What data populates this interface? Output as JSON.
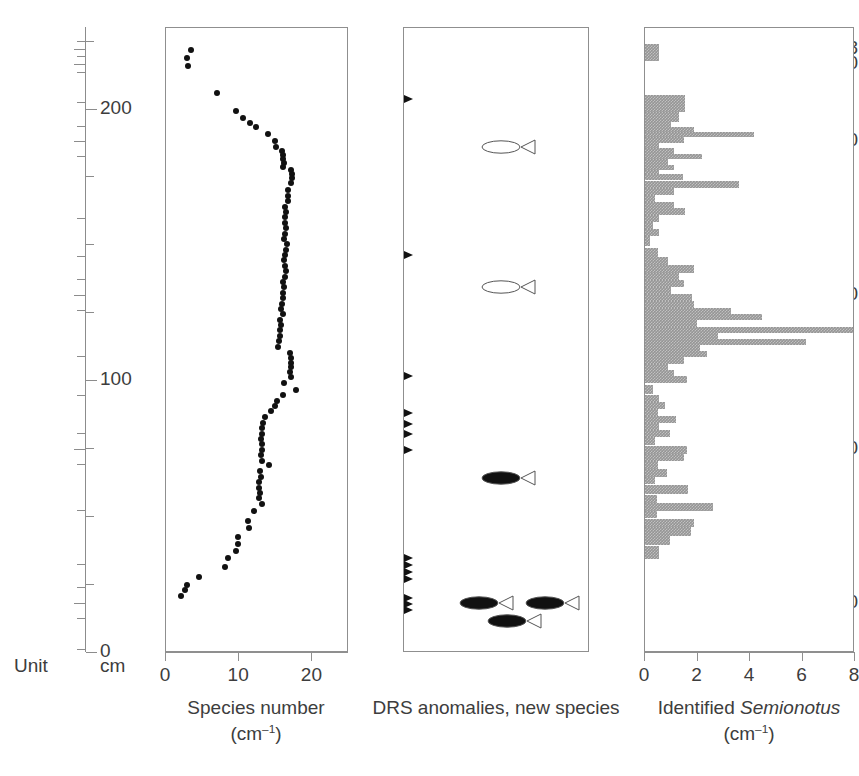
{
  "axes": {
    "unit_caption": "Unit",
    "cm_caption": "cm",
    "unit_ticks": [
      {
        "label": "118",
        "v": 118
      },
      {
        "label": "120",
        "v": 120
      },
      {
        "label": "130",
        "v": 130
      },
      {
        "label": "150",
        "v": 150
      },
      {
        "label": "170",
        "v": 170
      },
      {
        "label": "190",
        "v": 190
      }
    ],
    "unit_minor": [
      117,
      119,
      121,
      125,
      128,
      132,
      140,
      145,
      148,
      152,
      158,
      163,
      168,
      172,
      178,
      185,
      188,
      192,
      196
    ],
    "cm_ticks": [
      {
        "label": "200",
        "v": 200
      },
      {
        "label": "100",
        "v": 100
      },
      {
        "label": "0",
        "v": 0
      }
    ],
    "cm_range": [
      0,
      230
    ]
  },
  "chart_data": [
    {
      "type": "scatter",
      "panel": "species-number",
      "title": "",
      "xlabel": "Species number",
      "xlabel_unit": "(cm–1)",
      "ylabel": "Unit",
      "xlim": [
        0,
        25
      ],
      "ylim": [
        196,
        115
      ],
      "xticks": [
        0,
        10,
        20
      ],
      "xticklabels": [
        "0",
        "10",
        "20"
      ],
      "grid": false,
      "points": [
        {
          "x": 3.4,
          "y": 118.0
        },
        {
          "x": 2.9,
          "y": 119.1
        },
        {
          "x": 3.1,
          "y": 120.2
        },
        {
          "x": 7.1,
          "y": 123.7
        },
        {
          "x": 9.6,
          "y": 126.0
        },
        {
          "x": 10.7,
          "y": 126.9
        },
        {
          "x": 11.6,
          "y": 127.5
        },
        {
          "x": 12.4,
          "y": 128.1
        },
        {
          "x": 14.1,
          "y": 129.0
        },
        {
          "x": 15.1,
          "y": 129.9
        },
        {
          "x": 15.2,
          "y": 130.6
        },
        {
          "x": 16.0,
          "y": 131.2
        },
        {
          "x": 16.1,
          "y": 131.7
        },
        {
          "x": 16.2,
          "y": 132.2
        },
        {
          "x": 16.3,
          "y": 132.7
        },
        {
          "x": 16.2,
          "y": 133.2
        },
        {
          "x": 17.3,
          "y": 133.6
        },
        {
          "x": 17.4,
          "y": 134.2
        },
        {
          "x": 17.4,
          "y": 134.7
        },
        {
          "x": 17.2,
          "y": 135.4
        },
        {
          "x": 16.9,
          "y": 136.2
        },
        {
          "x": 16.8,
          "y": 137.0
        },
        {
          "x": 16.9,
          "y": 137.7
        },
        {
          "x": 16.5,
          "y": 138.4
        },
        {
          "x": 16.6,
          "y": 139.1
        },
        {
          "x": 16.4,
          "y": 139.8
        },
        {
          "x": 16.5,
          "y": 140.5
        },
        {
          "x": 16.6,
          "y": 141.2
        },
        {
          "x": 16.4,
          "y": 141.9
        },
        {
          "x": 16.3,
          "y": 142.6
        },
        {
          "x": 16.7,
          "y": 143.3
        },
        {
          "x": 16.6,
          "y": 144.0
        },
        {
          "x": 16.4,
          "y": 144.7
        },
        {
          "x": 16.3,
          "y": 145.4
        },
        {
          "x": 16.5,
          "y": 146.1
        },
        {
          "x": 16.6,
          "y": 146.8
        },
        {
          "x": 16.4,
          "y": 147.5
        },
        {
          "x": 16.2,
          "y": 148.2
        },
        {
          "x": 16.3,
          "y": 148.9
        },
        {
          "x": 16.1,
          "y": 149.6
        },
        {
          "x": 16.2,
          "y": 150.3
        },
        {
          "x": 16.0,
          "y": 151.0
        },
        {
          "x": 15.9,
          "y": 151.7
        },
        {
          "x": 16.1,
          "y": 152.4
        },
        {
          "x": 15.8,
          "y": 153.1
        },
        {
          "x": 15.9,
          "y": 153.8
        },
        {
          "x": 15.7,
          "y": 154.5
        },
        {
          "x": 15.8,
          "y": 155.2
        },
        {
          "x": 15.6,
          "y": 155.9
        },
        {
          "x": 15.5,
          "y": 156.6
        },
        {
          "x": 17.1,
          "y": 157.4
        },
        {
          "x": 17.2,
          "y": 158.1
        },
        {
          "x": 17.3,
          "y": 158.7
        },
        {
          "x": 17.2,
          "y": 159.3
        },
        {
          "x": 17.1,
          "y": 159.9
        },
        {
          "x": 17.2,
          "y": 160.5
        },
        {
          "x": 16.3,
          "y": 161.3
        },
        {
          "x": 18.0,
          "y": 162.2
        },
        {
          "x": 16.1,
          "y": 162.9
        },
        {
          "x": 15.3,
          "y": 163.7
        },
        {
          "x": 15.0,
          "y": 164.3
        },
        {
          "x": 14.5,
          "y": 165.0
        },
        {
          "x": 13.7,
          "y": 165.8
        },
        {
          "x": 13.4,
          "y": 166.5
        },
        {
          "x": 13.3,
          "y": 167.2
        },
        {
          "x": 13.2,
          "y": 167.9
        },
        {
          "x": 13.1,
          "y": 168.6
        },
        {
          "x": 13.2,
          "y": 169.3
        },
        {
          "x": 13.3,
          "y": 170.0
        },
        {
          "x": 13.1,
          "y": 170.7
        },
        {
          "x": 13.2,
          "y": 171.4
        },
        {
          "x": 14.2,
          "y": 172.0
        },
        {
          "x": 13.0,
          "y": 172.8
        },
        {
          "x": 13.1,
          "y": 173.5
        },
        {
          "x": 12.9,
          "y": 174.2
        },
        {
          "x": 12.8,
          "y": 174.9
        },
        {
          "x": 13.0,
          "y": 175.6
        },
        {
          "x": 12.9,
          "y": 176.3
        },
        {
          "x": 13.2,
          "y": 177.0
        },
        {
          "x": 12.1,
          "y": 178.0
        },
        {
          "x": 11.3,
          "y": 179.2
        },
        {
          "x": 11.5,
          "y": 180.1
        },
        {
          "x": 10.0,
          "y": 181.3
        },
        {
          "x": 9.9,
          "y": 182.2
        },
        {
          "x": 9.6,
          "y": 183.1
        },
        {
          "x": 8.6,
          "y": 184.0
        },
        {
          "x": 8.1,
          "y": 185.2
        },
        {
          "x": 4.6,
          "y": 186.5
        },
        {
          "x": 2.9,
          "y": 187.6
        },
        {
          "x": 2.6,
          "y": 188.2
        },
        {
          "x": 2.1,
          "y": 189.0
        }
      ]
    },
    {
      "type": "scatter",
      "panel": "drs-anomalies",
      "title": "",
      "xlabel": "DRS anomalies, new species",
      "xlabel_unit": "",
      "xlim": [
        0,
        1
      ],
      "ylim": [
        196,
        115
      ],
      "xticks": [],
      "grid": false,
      "arrows": [
        {
          "y": 124.4
        },
        {
          "y": 144.7
        },
        {
          "y": 160.4
        },
        {
          "y": 165.2
        },
        {
          "y": 166.6
        },
        {
          "y": 167.9
        },
        {
          "y": 170.0
        },
        {
          "y": 184.0
        },
        {
          "y": 185.0
        },
        {
          "y": 185.9
        },
        {
          "y": 186.8
        },
        {
          "y": 189.2
        },
        {
          "y": 190.0
        },
        {
          "y": 190.8
        }
      ],
      "fish": [
        {
          "y": 130.7,
          "x": 0.42,
          "filled": false
        },
        {
          "y": 148.9,
          "x": 0.42,
          "filled": false
        },
        {
          "y": 173.6,
          "x": 0.42,
          "filled": true
        },
        {
          "y": 189.9,
          "x": 0.3,
          "filled": true
        },
        {
          "y": 189.9,
          "x": 0.66,
          "filled": true
        },
        {
          "y": 192.2,
          "x": 0.45,
          "filled": true
        }
      ]
    },
    {
      "type": "bar",
      "orientation": "horizontal",
      "panel": "identified-semionotus",
      "title": "",
      "xlabel": "Identified Semionotus",
      "xlabel_italic_word": "Semionotus",
      "xlabel_unit": "(cm–1)",
      "xlim": [
        0,
        8
      ],
      "ylim": [
        196,
        115
      ],
      "xticks": [
        0,
        2,
        4,
        6,
        8
      ],
      "xticklabels": [
        "0",
        "2",
        "4",
        "6",
        "8"
      ],
      "grid": false,
      "bars": [
        {
          "y": 118.4,
          "h": 2.3,
          "value": 0.55
        },
        {
          "y": 125.0,
          "h": 2.1,
          "value": 1.55
        },
        {
          "y": 126.7,
          "h": 1.3,
          "value": 1.3
        },
        {
          "y": 127.7,
          "h": 0.8,
          "value": 1.0
        },
        {
          "y": 128.4,
          "h": 0.7,
          "value": 1.9
        },
        {
          "y": 129.0,
          "h": 0.6,
          "value": 4.2
        },
        {
          "y": 129.7,
          "h": 0.8,
          "value": 1.5
        },
        {
          "y": 130.5,
          "h": 0.8,
          "value": 0.55
        },
        {
          "y": 131.2,
          "h": 0.7,
          "value": 1.1
        },
        {
          "y": 131.9,
          "h": 0.7,
          "value": 2.2
        },
        {
          "y": 132.6,
          "h": 0.7,
          "value": 0.9
        },
        {
          "y": 133.3,
          "h": 0.7,
          "value": 1.1
        },
        {
          "y": 133.9,
          "h": 0.6,
          "value": 0.55
        },
        {
          "y": 134.6,
          "h": 0.8,
          "value": 1.45
        },
        {
          "y": 135.5,
          "h": 0.9,
          "value": 3.6
        },
        {
          "y": 136.4,
          "h": 0.9,
          "value": 1.1
        },
        {
          "y": 137.3,
          "h": 0.9,
          "value": 0.4
        },
        {
          "y": 138.2,
          "h": 0.9,
          "value": 1.1
        },
        {
          "y": 139.1,
          "h": 0.9,
          "value": 1.55
        },
        {
          "y": 140.0,
          "h": 0.9,
          "value": 0.55
        },
        {
          "y": 140.9,
          "h": 0.9,
          "value": 0.3
        },
        {
          "y": 141.8,
          "h": 0.9,
          "value": 0.55
        },
        {
          "y": 142.9,
          "h": 1.3,
          "value": 0.2
        },
        {
          "y": 144.4,
          "h": 1.2,
          "value": 0.5
        },
        {
          "y": 145.5,
          "h": 1.0,
          "value": 0.9
        },
        {
          "y": 146.5,
          "h": 1.0,
          "value": 1.9
        },
        {
          "y": 147.5,
          "h": 1.0,
          "value": 1.3
        },
        {
          "y": 148.4,
          "h": 0.9,
          "value": 1.5
        },
        {
          "y": 149.3,
          "h": 0.9,
          "value": 1.0
        },
        {
          "y": 150.2,
          "h": 0.9,
          "value": 1.8
        },
        {
          "y": 151.1,
          "h": 0.9,
          "value": 1.9
        },
        {
          "y": 152.0,
          "h": 0.9,
          "value": 3.3
        },
        {
          "y": 152.8,
          "h": 0.8,
          "value": 4.5
        },
        {
          "y": 153.6,
          "h": 0.8,
          "value": 2.0
        },
        {
          "y": 154.4,
          "h": 0.8,
          "value": 8.0
        },
        {
          "y": 155.2,
          "h": 0.8,
          "value": 2.8
        },
        {
          "y": 156.0,
          "h": 0.8,
          "value": 6.2
        },
        {
          "y": 156.8,
          "h": 0.8,
          "value": 2.1
        },
        {
          "y": 157.6,
          "h": 0.8,
          "value": 2.4
        },
        {
          "y": 158.4,
          "h": 0.8,
          "value": 1.5
        },
        {
          "y": 159.2,
          "h": 0.8,
          "value": 0.9
        },
        {
          "y": 160.0,
          "h": 0.8,
          "value": 1.1
        },
        {
          "y": 160.9,
          "h": 0.9,
          "value": 1.6
        },
        {
          "y": 162.2,
          "h": 1.2,
          "value": 0.3
        },
        {
          "y": 163.4,
          "h": 1.0,
          "value": 0.55
        },
        {
          "y": 164.3,
          "h": 0.9,
          "value": 0.75
        },
        {
          "y": 165.2,
          "h": 0.9,
          "value": 0.5
        },
        {
          "y": 166.1,
          "h": 0.9,
          "value": 1.2
        },
        {
          "y": 167.0,
          "h": 0.9,
          "value": 0.55
        },
        {
          "y": 167.9,
          "h": 0.9,
          "value": 0.95
        },
        {
          "y": 168.9,
          "h": 1.0,
          "value": 0.4
        },
        {
          "y": 170.0,
          "h": 1.0,
          "value": 1.6
        },
        {
          "y": 171.0,
          "h": 1.0,
          "value": 1.5
        },
        {
          "y": 172.0,
          "h": 1.0,
          "value": 0.5
        },
        {
          "y": 173.0,
          "h": 1.0,
          "value": 0.85
        },
        {
          "y": 174.0,
          "h": 1.0,
          "value": 0.4
        },
        {
          "y": 175.2,
          "h": 1.2,
          "value": 1.65
        },
        {
          "y": 176.4,
          "h": 1.1,
          "value": 0.45
        },
        {
          "y": 177.4,
          "h": 1.0,
          "value": 2.6
        },
        {
          "y": 178.4,
          "h": 1.0,
          "value": 0.45
        },
        {
          "y": 179.5,
          "h": 1.1,
          "value": 1.9
        },
        {
          "y": 180.6,
          "h": 1.1,
          "value": 1.75
        },
        {
          "y": 181.8,
          "h": 1.2,
          "value": 0.95
        },
        {
          "y": 183.4,
          "h": 1.7,
          "value": 0.55
        }
      ]
    }
  ]
}
